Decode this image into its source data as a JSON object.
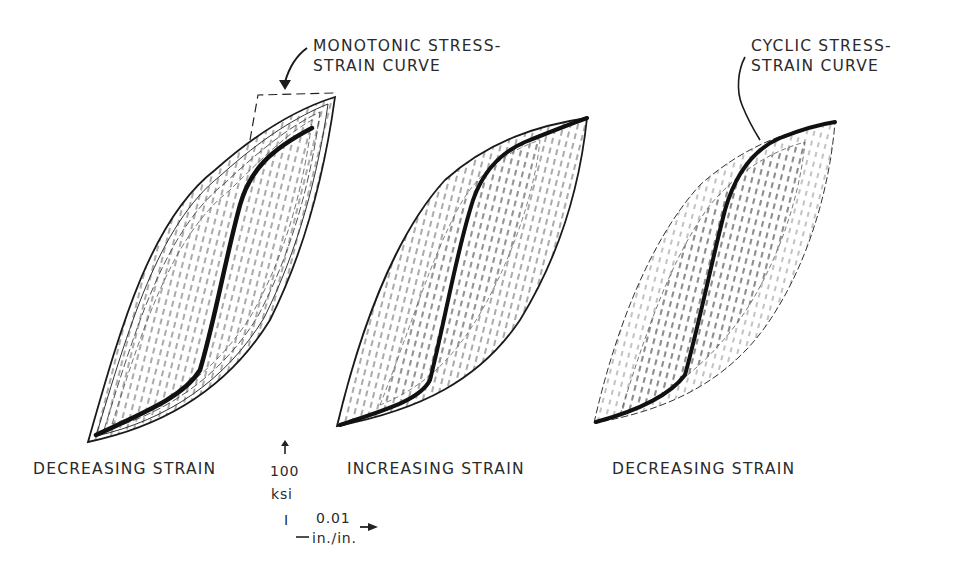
{
  "figure": {
    "annotations": {
      "monotonic": {
        "line1": "MONOTONIC STRESS-",
        "line2": "STRAIN CURVE"
      },
      "cyclic": {
        "line1": "CYCLIC STRESS-",
        "line2": "STRAIN CURVE"
      }
    },
    "panels": [
      {
        "caption": "DECREASING STRAIN"
      },
      {
        "caption": "INCREASING STRAIN"
      },
      {
        "caption": "DECREASING STRAIN"
      }
    ],
    "scale": {
      "stress_value": "100",
      "stress_unit": "ksi",
      "strain_tick": "I",
      "strain_value": "0.01",
      "strain_unit": "in./in."
    },
    "colors": {
      "ink": "#1a1a1a",
      "hatch": "#555555",
      "background": "#ffffff"
    }
  }
}
